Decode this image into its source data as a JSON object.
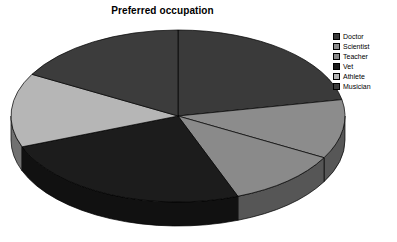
{
  "chart_data": {
    "type": "pie",
    "title": "Preferred occupation",
    "xlabel": "",
    "ylabel": "",
    "legend_position": "top-right",
    "three_d": true,
    "grid": false,
    "categories": [
      "Doctor",
      "Scientist",
      "Teacher",
      "Vet",
      "Athlete",
      "Musician"
    ],
    "values": [
      22,
      11,
      11,
      25,
      14,
      17
    ],
    "slices": [
      {
        "label": "Doctor",
        "value": 22,
        "color": "#3a3a3a",
        "start_deg": 270,
        "sweep_deg": 79
      },
      {
        "label": "Scientist",
        "value": 11,
        "color": "#8c8c8c",
        "start_deg": 349,
        "sweep_deg": 40
      },
      {
        "label": "Teacher",
        "value": 11,
        "color": "#8a8a8a",
        "start_deg": 29,
        "sweep_deg": 40
      },
      {
        "label": "Vet",
        "value": 25,
        "color": "#1c1c1c",
        "start_deg": 69,
        "sweep_deg": 90
      },
      {
        "label": "Athlete",
        "value": 14,
        "color": "#b6b6b6",
        "start_deg": 159,
        "sweep_deg": 50
      },
      {
        "label": "Musician",
        "value": 17,
        "color": "#3c3c3c",
        "start_deg": 209,
        "sweep_deg": 61
      }
    ],
    "geometry": {
      "center_x": 178,
      "center_y": 116,
      "radius_x": 167,
      "radius_y": 86,
      "depth": 24
    },
    "colors": {
      "background": "#ffffff",
      "outline": "#000000",
      "title": "#000000"
    }
  },
  "legend": {
    "items": [
      {
        "label": "Doctor"
      },
      {
        "label": "Scientist"
      },
      {
        "label": "Teacher"
      },
      {
        "label": "Vet"
      },
      {
        "label": "Athlete"
      },
      {
        "label": "Musician"
      }
    ]
  }
}
